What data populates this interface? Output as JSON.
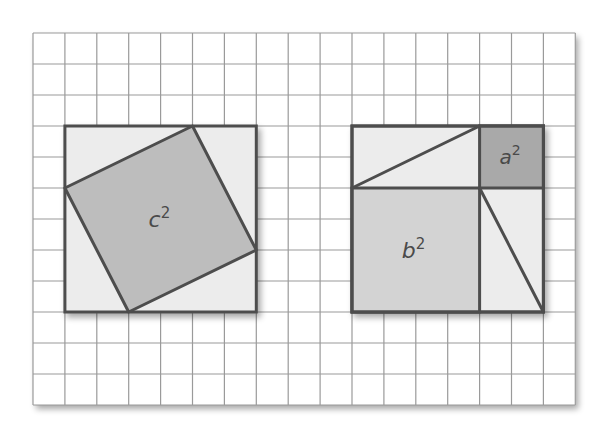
{
  "figure": {
    "grid": {
      "columns": 17,
      "rows": 12,
      "origin_px": [
        33,
        33
      ],
      "cell_px": [
        31.9,
        31
      ],
      "line_color": "#9a9a9a",
      "background": "#ffffff"
    },
    "colors": {
      "outline": "#4d4d4d",
      "light_fill": "#ececec",
      "medium_fill": "#d3d3d3",
      "c_square_fill": "#bdbdbd",
      "a_square_fill": "#a9a9a9",
      "label_color": "#4a4a4a"
    },
    "left_square": {
      "outer": {
        "x": 1,
        "y": 3,
        "size": 6
      },
      "tilted_square_vertices": [
        [
          5,
          3
        ],
        [
          7,
          7
        ],
        [
          3,
          9
        ],
        [
          1,
          5
        ]
      ],
      "label": "c",
      "exponent": "2"
    },
    "right_square": {
      "outer": {
        "x": 10,
        "y": 3,
        "size": 6
      },
      "a_square": {
        "x": 14,
        "y": 3,
        "size": 2,
        "label": "a",
        "exponent": "2"
      },
      "b_square": {
        "x": 10,
        "y": 5,
        "size": 4,
        "label": "b",
        "exponent": "2"
      },
      "diagonals": [
        [
          [
            10,
            5
          ],
          [
            14,
            3
          ]
        ],
        [
          [
            14,
            5
          ],
          [
            16,
            9
          ]
        ]
      ]
    }
  }
}
